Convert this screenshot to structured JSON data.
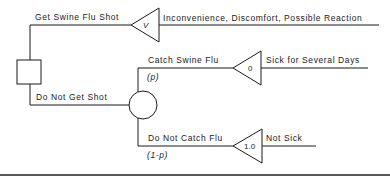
{
  "diagram": {
    "type": "decision-tree",
    "decision_node": {
      "shape": "square"
    },
    "branches": {
      "shot": {
        "label": "Get Swine Flu Shot",
        "terminal_value": "V",
        "outcome": "Inconvenience, Discomfort, Possible Reaction"
      },
      "no_shot": {
        "label": "Do Not Get Shot",
        "chance_node": {
          "shape": "circle"
        },
        "catch": {
          "label": "Catch Swine Flu",
          "probability": "(p)",
          "terminal_value": "0",
          "outcome": "Sick for Several Days"
        },
        "no_catch": {
          "label": "Do Not Catch Flu",
          "probability": "(1-p)",
          "terminal_value": "1.0",
          "outcome": "Not Sick"
        }
      }
    },
    "colors": {
      "line": "#1a1a1a",
      "background": "#ffffff"
    }
  }
}
